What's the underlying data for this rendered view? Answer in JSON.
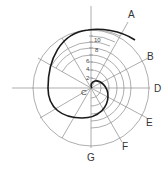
{
  "diagram": {
    "center": {
      "x": 91,
      "y": 88
    },
    "outer_radius": 58,
    "colors": {
      "guide": "#8a8a8a",
      "spiral": "#1a1a1a",
      "text": "#333333"
    },
    "ray_labels": [
      {
        "label": "A",
        "x": 128,
        "y": 10
      },
      {
        "label": "B",
        "x": 147,
        "y": 52
      },
      {
        "label": "D",
        "x": 154,
        "y": 84
      },
      {
        "label": "E",
        "x": 146,
        "y": 118
      },
      {
        "label": "F",
        "x": 122,
        "y": 142
      },
      {
        "label": "G",
        "x": 87,
        "y": 153
      }
    ],
    "center_label": {
      "label": "C",
      "x": 81,
      "y": 88
    },
    "scale_labels": [
      {
        "label": "10",
        "x": 94,
        "y": 37
      },
      {
        "label": "8",
        "x": 95,
        "y": 47
      },
      {
        "label": "6",
        "x": 86,
        "y": 58
      },
      {
        "label": "4",
        "x": 86,
        "y": 66
      },
      {
        "label": "2",
        "x": 86,
        "y": 75
      }
    ]
  }
}
